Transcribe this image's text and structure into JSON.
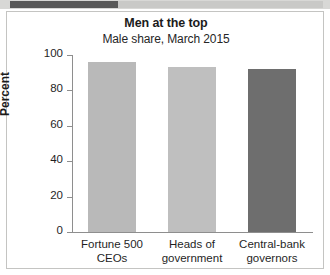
{
  "decor": {
    "band_dark_color": "#595959",
    "band_light_color": "#c9c9c7"
  },
  "chart_data": {
    "type": "bar",
    "title": "Men at the top",
    "subtitle": "Male share, March 2015",
    "xlabel": "",
    "ylabel": "Percent",
    "ylim": [
      0,
      100
    ],
    "yticks": [
      0,
      20,
      40,
      60,
      80,
      100
    ],
    "ytick_labels": [
      "0",
      "20",
      "40",
      "60",
      "80",
      "100"
    ],
    "grid": false,
    "legend": "none",
    "categories": [
      "Fortune 500\nCEOs",
      "Heads of\ngovernment",
      "Central-bank\ngovernors"
    ],
    "category_lines": [
      [
        "Fortune 500",
        "CEOs"
      ],
      [
        "Heads of",
        "government"
      ],
      [
        "Central-bank",
        "governors"
      ]
    ],
    "values": [
      96,
      93,
      92
    ],
    "bar_colors": [
      "#b9b9b9",
      "#bfbfbf",
      "#6e6e6e"
    ]
  }
}
